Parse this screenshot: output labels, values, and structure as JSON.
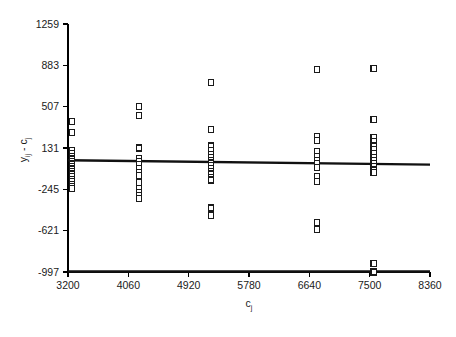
{
  "chart_data": {
    "type": "scatter",
    "title": "",
    "xlabel": "c_j",
    "ylabel": "y_ij - c_j",
    "xlabel_main": "c",
    "xlabel_sub": "j",
    "ylabel_main_1": "y",
    "ylabel_sub_1": "ij",
    "ylabel_sep": " - ",
    "ylabel_main_2": "c",
    "ylabel_sub_2": "j",
    "xlim": [
      3200,
      8360
    ],
    "ylim": [
      -997,
      1259
    ],
    "xticks": [
      3200,
      4060,
      4920,
      5780,
      6640,
      7500,
      8360
    ],
    "yticks": [
      -997,
      -621,
      -245,
      131,
      507,
      883,
      1259
    ],
    "xtick_labels": [
      "3200",
      "4060",
      "4920",
      "5780",
      "6640",
      "7500",
      "8360"
    ],
    "ytick_labels": [
      "-997",
      "-621",
      "-245",
      "131",
      "507",
      "883",
      "1259"
    ],
    "grid": false,
    "legend": false,
    "marker": "open-square",
    "marker_color": "#1a1a1a",
    "reference_line": {
      "name": "zero-trend-line",
      "x_start": 3200,
      "x_end": 8360,
      "y_start": 20,
      "y_end": -20
    },
    "baseline_line": {
      "name": "axis-baseline-line",
      "x_start": 3200,
      "x_end": 8360,
      "y": -997
    },
    "groups": [
      {
        "x": 3255,
        "values": [
          370,
          270,
          105,
          80,
          55,
          30,
          10,
          -15,
          -40,
          -60,
          -85,
          -105,
          -130,
          -155,
          -175,
          -200,
          -220,
          -240
        ]
      },
      {
        "x": 4215,
        "values": [
          510,
          425,
          130,
          35,
          10,
          -20,
          -55,
          -90,
          -120,
          -185,
          -235,
          -275,
          -300,
          -330
        ]
      },
      {
        "x": 5240,
        "values": [
          730,
          300,
          150,
          110,
          75,
          45,
          20,
          -5,
          -30,
          -55,
          -80,
          -105,
          -135,
          -160,
          -415,
          -480
        ]
      },
      {
        "x": 6750,
        "values": [
          845,
          235,
          200,
          100,
          55,
          20,
          -10,
          -45,
          -130,
          -175,
          -545,
          -610
        ]
      },
      {
        "x": 7555,
        "values": [
          855,
          390,
          225,
          190,
          150,
          115,
          80,
          45,
          15,
          -10,
          -35,
          -70,
          -95,
          -920,
          -997
        ]
      }
    ]
  }
}
